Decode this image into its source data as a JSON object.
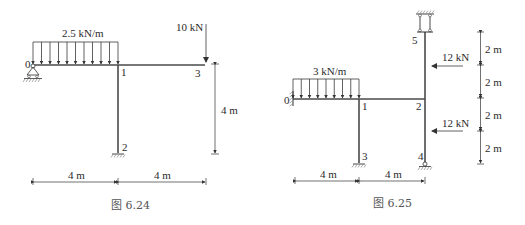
{
  "figures": [
    {
      "id": "fig-6-24",
      "caption": "图 6.24",
      "nodes": [
        "0",
        "1",
        "2",
        "3"
      ],
      "distributed_load": {
        "label": "2.5 kN/m",
        "from_node": "0",
        "to_node": "1"
      },
      "point_load": {
        "label": "10 kN",
        "node": "3",
        "direction": "down"
      },
      "dimensions": {
        "horizontal": [
          "4 m",
          "4 m"
        ],
        "vertical": [
          "4 m"
        ]
      },
      "supports": {
        "0": "pin",
        "2": "fixed"
      }
    },
    {
      "id": "fig-6-25",
      "caption": "图 6.25",
      "nodes": [
        "0",
        "1",
        "2",
        "3",
        "4",
        "5"
      ],
      "distributed_load": {
        "label": "3 kN/m",
        "from_node": "0",
        "to_node": "1"
      },
      "point_loads": [
        {
          "label": "12 kN",
          "direction": "left",
          "position": "between 5 and 2"
        },
        {
          "label": "12 kN",
          "direction": "left",
          "position": "between 2 and 4"
        }
      ],
      "dimensions": {
        "horizontal": [
          "4 m",
          "4 m"
        ],
        "vertical": [
          "2 m",
          "2 m",
          "2 m",
          "2 m"
        ]
      },
      "supports": {
        "0": "fixed-wall",
        "3": "fixed",
        "4": "pin",
        "5": "double-link"
      }
    }
  ]
}
